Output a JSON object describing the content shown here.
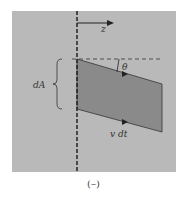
{
  "figure": {
    "caption": "(–)",
    "labels": {
      "axis": "z",
      "angle": "θ",
      "area": "dA",
      "displacement": "v dt"
    },
    "colors": {
      "panel": "#b8b8b8",
      "parallelogram": "#8c8c8c",
      "lines": "#222222"
    }
  }
}
